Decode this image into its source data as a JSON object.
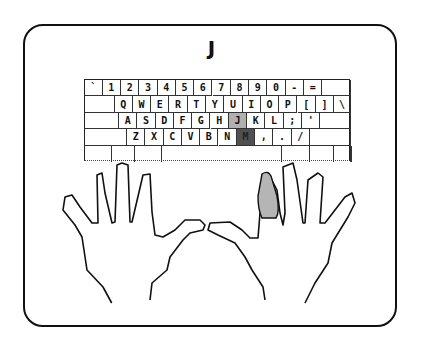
{
  "target_letter": "J",
  "highlight": {
    "home_key": "J",
    "target_key": "M",
    "finger": "right-index"
  },
  "colors": {
    "home_key_bg": "#b0b0b0",
    "target_key_bg": "#505050",
    "finger_fill": "#b5b5b5",
    "outline": "#111111"
  },
  "keyboard": {
    "rows": [
      [
        "`",
        "1",
        "2",
        "3",
        "4",
        "5",
        "6",
        "7",
        "8",
        "9",
        "0",
        "-",
        "=",
        ""
      ],
      [
        "",
        "Q",
        "W",
        "E",
        "R",
        "T",
        "Y",
        "U",
        "I",
        "O",
        "P",
        "[",
        "]",
        "\\"
      ],
      [
        "",
        "A",
        "S",
        "D",
        "F",
        "G",
        "H",
        "J",
        "K",
        "L",
        ";",
        "'",
        ""
      ],
      [
        "",
        "Z",
        "X",
        "C",
        "V",
        "B",
        "N",
        "M",
        ",",
        ".",
        "/",
        ""
      ],
      [
        "",
        "",
        "",
        "",
        "",
        "",
        "",
        ""
      ]
    ]
  }
}
